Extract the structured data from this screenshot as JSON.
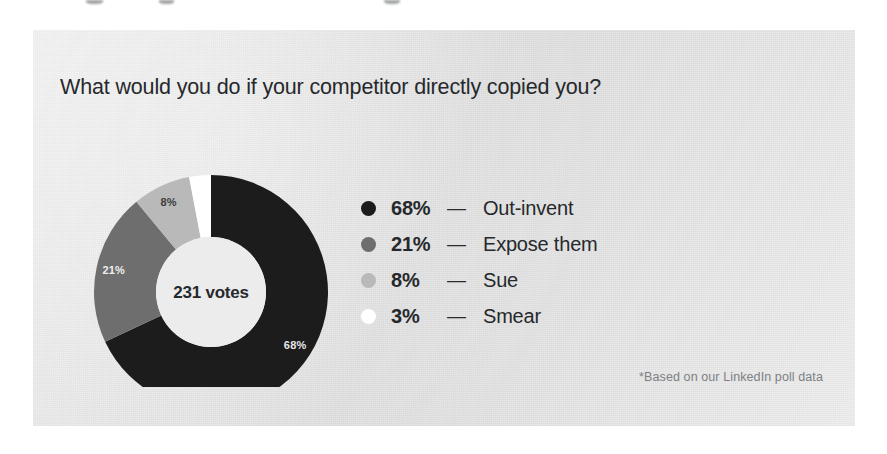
{
  "card": {
    "title": "What would you do if your competitor directly copied you?",
    "footnote": "*Based on our LinkedIn poll data",
    "background_color": "#e9e9e9"
  },
  "chart_data": {
    "type": "pie",
    "variant": "donut",
    "title": "What would you do if your competitor directly copied you?",
    "center_label": "231 votes",
    "total_votes": 231,
    "unit": "%",
    "start_angle_deg": 0,
    "direction": "clockwise",
    "legend_position": "right",
    "grid": false,
    "categories": [
      "Out-invent",
      "Expose them",
      "Sue",
      "Smear"
    ],
    "values": [
      68,
      21,
      8,
      3
    ],
    "colors": [
      "#1c1c1c",
      "#6e6e6e",
      "#b9b9b9",
      "#ffffff"
    ],
    "slices": [
      {
        "label": "Out-invent",
        "percent": "68%",
        "value": 68,
        "color": "#1c1c1c",
        "arc_label": "68%",
        "arc_label_color": "#e6e6e6"
      },
      {
        "label": "Expose them",
        "percent": "21%",
        "value": 21,
        "color": "#6e6e6e",
        "arc_label": "21%",
        "arc_label_color": "#efefef"
      },
      {
        "label": "Sue",
        "percent": "8%",
        "value": 8,
        "color": "#b9b9b9",
        "arc_label": "8%",
        "arc_label_color": "#3a3d40"
      },
      {
        "label": "Smear",
        "percent": "3%",
        "value": 3,
        "color": "#ffffff",
        "arc_label": "",
        "arc_label_color": "#3a3d40"
      }
    ],
    "annotations": [
      "*Based on our LinkedIn poll data"
    ]
  },
  "legend": {
    "dash": "—",
    "rows": [
      {
        "percent": "68%",
        "dash": "—",
        "label": "Out-invent",
        "color": "#1c1c1c"
      },
      {
        "percent": "21%",
        "dash": "—",
        "label": "Expose them",
        "color": "#6e6e6e"
      },
      {
        "percent": "8%",
        "dash": "—",
        "label": "Sue",
        "color": "#b9b9b9"
      },
      {
        "percent": "3%",
        "dash": "—",
        "label": "Smear",
        "color": "#ffffff"
      }
    ]
  }
}
